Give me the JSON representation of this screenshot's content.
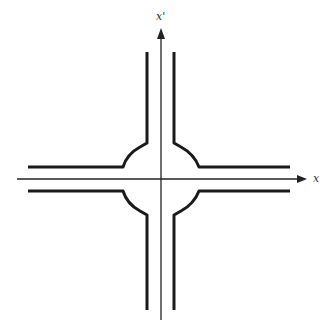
{
  "diagram": {
    "type": "intersection-schematic",
    "axes": {
      "x_label": "x",
      "y_label": "x'"
    },
    "colors": {
      "axis": "#222222",
      "road": "#1a1a1a",
      "label": "#333333"
    }
  }
}
